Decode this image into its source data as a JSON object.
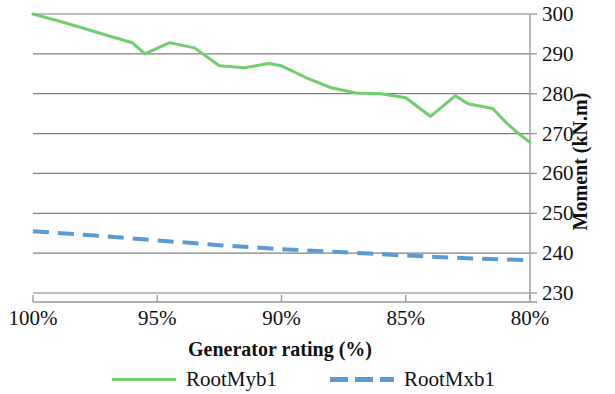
{
  "chart_data": {
    "type": "line",
    "title": "",
    "xlabel": "Generator rating (%)",
    "ylabel": "Moment (kN.m)",
    "xlim": [
      100,
      80
    ],
    "ylim": [
      230,
      300
    ],
    "x_tick_labels": [
      "100%",
      "95%",
      "90%",
      "85%",
      "80%"
    ],
    "x_tick_values": [
      100,
      95,
      90,
      85,
      80
    ],
    "y_tick_labels": [
      "230",
      "240",
      "250",
      "260",
      "270",
      "280",
      "290",
      "300"
    ],
    "y_tick_values": [
      230,
      240,
      250,
      260,
      270,
      280,
      290,
      300
    ],
    "grid": "horizontal",
    "legend_position": "bottom",
    "x_axis_direction": "descending",
    "series": [
      {
        "name": "RootMyb1",
        "color": "#6fce6f",
        "style": "solid",
        "x": [
          100.0,
          99.0,
          98.0,
          97.0,
          96.0,
          95.5,
          94.5,
          93.5,
          92.5,
          91.5,
          90.5,
          90.0,
          89.0,
          88.0,
          87.0,
          86.0,
          85.0,
          84.0,
          83.0,
          82.5,
          81.5,
          81.0,
          80.5,
          80.0
        ],
        "values": [
          300.0,
          298.3,
          296.5,
          294.6,
          292.8,
          290.0,
          292.8,
          291.5,
          287.0,
          286.5,
          287.6,
          287.0,
          284.0,
          281.5,
          280.2,
          280.0,
          279.0,
          274.3,
          279.5,
          277.5,
          276.3,
          273.0,
          270.2,
          267.8
        ]
      },
      {
        "name": "RootMxb1",
        "color": "#5b9bd5",
        "style": "dashed",
        "x": [
          100.0,
          97.5,
          95.0,
          92.5,
          90.0,
          87.5,
          85.0,
          82.5,
          80.0
        ],
        "values": [
          245.5,
          244.4,
          243.2,
          242.0,
          241.0,
          240.2,
          239.4,
          238.7,
          238.2
        ]
      }
    ]
  },
  "legend": {
    "entries": [
      {
        "label": "RootMyb1",
        "color": "#6fce6f",
        "style": "solid"
      },
      {
        "label": "RootMxb1",
        "color": "#5b9bd5",
        "style": "dashed"
      }
    ]
  },
  "colors": {
    "series_green": "#6fce6f",
    "series_blue": "#5b9bd5",
    "gridline": "#808080",
    "axis": "#9a9a9a",
    "text": "#111111"
  }
}
